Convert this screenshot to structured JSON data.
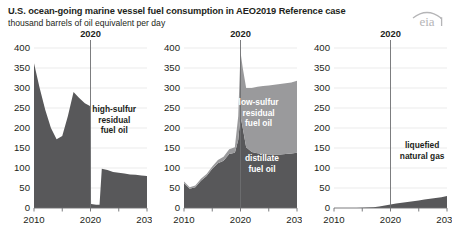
{
  "header": {
    "title": "U.S. ocean-going marine vessel fuel consumption in AEO2019 Reference case",
    "subtitle": "thousand barrels of oil equivalent per day",
    "logo_text": "eia"
  },
  "colors": {
    "dark_fill": "#58585a",
    "light_fill": "#9a9a9c",
    "axis": "#6d6e71",
    "grid": "#e3e3e3",
    "text": "#231f20",
    "logo": "#b5b5b7"
  },
  "chart_data": {
    "type": "area",
    "title": "U.S. ocean-going marine vessel fuel consumption in AEO2019 Reference case",
    "subtitle": "thousand barrels of oil equivalent per day",
    "ylabel": "thousand barrels of oil equivalent per day",
    "xlabel": "",
    "ylim": [
      0,
      400
    ],
    "xlim": [
      2010,
      2030
    ],
    "yticks": [
      0,
      50,
      100,
      150,
      200,
      250,
      300,
      350,
      400
    ],
    "xticks": [
      2010,
      2020,
      2030
    ],
    "grid": true,
    "legend_position": "inline-annotation",
    "projection_marker_year": 2020,
    "projection_marker_label": "2020",
    "panels": [
      {
        "id": "high-sulfur-residual-fuel-oil",
        "annotation": [
          "high-sulfur",
          "residual",
          "fuel oil"
        ],
        "annotation_color": "dark",
        "series": [
          {
            "name": "high-sulfur residual fuel oil",
            "fill": "#58585a",
            "x": [
              2010,
              2011,
              2012,
              2013,
              2014,
              2015,
              2016,
              2017,
              2018,
              2019,
              2019.9,
              2020.1,
              2021,
              2021.6,
              2022,
              2023,
              2024,
              2025,
              2026,
              2027,
              2028,
              2029,
              2030
            ],
            "values": [
              362,
              300,
              245,
              200,
              172,
              180,
              230,
              290,
              275,
              262,
              255,
              10,
              8,
              8,
              98,
              95,
              90,
              88,
              86,
              84,
              83,
              81,
              80
            ]
          }
        ]
      },
      {
        "id": "low-sulfur-residual-and-distillate",
        "annotation_upper": [
          "low-sulfur",
          "residual",
          "fuel oil"
        ],
        "annotation_lower": [
          "distillate",
          "fuel oil"
        ],
        "annotation_color": "white",
        "stacked": true,
        "x": [
          2010,
          2011,
          2012,
          2013,
          2014,
          2015,
          2016,
          2017,
          2018,
          2019,
          2019.6,
          2020,
          2020.4,
          2021,
          2022,
          2023,
          2024,
          2025,
          2026,
          2027,
          2028,
          2029,
          2030
        ],
        "series": [
          {
            "name": "distillate fuel oil",
            "fill": "#58585a",
            "values": [
              62,
              48,
              52,
              68,
              80,
              98,
              112,
              118,
              135,
              138,
              170,
              230,
              200,
              152,
              140,
              137,
              135,
              134,
              134,
              134,
              135,
              136,
              138
            ]
          },
          {
            "name": "low-sulfur residual fuel oil",
            "fill": "#9a9a9c",
            "values": [
              4,
              4,
              4,
              5,
              5,
              6,
              8,
              10,
              12,
              14,
              60,
              160,
              150,
              148,
              160,
              166,
              170,
              172,
              174,
              176,
              177,
              178,
              180
            ]
          }
        ]
      },
      {
        "id": "liquefied-natural-gas",
        "annotation": [
          "liquefied",
          "natural gas"
        ],
        "annotation_color": "dark",
        "series": [
          {
            "name": "liquefied natural gas",
            "fill": "#58585a",
            "x": [
              2010,
              2012,
              2014,
              2016,
              2017,
              2018,
              2019,
              2020,
              2021,
              2022,
              2023,
              2024,
              2025,
              2026,
              2027,
              2028,
              2029,
              2030
            ],
            "values": [
              0,
              0,
              0,
              1,
              2,
              4,
              6,
              9,
              11,
              13,
              15,
              17,
              19,
              21,
              23,
              25,
              27,
              30
            ]
          }
        ]
      }
    ]
  }
}
